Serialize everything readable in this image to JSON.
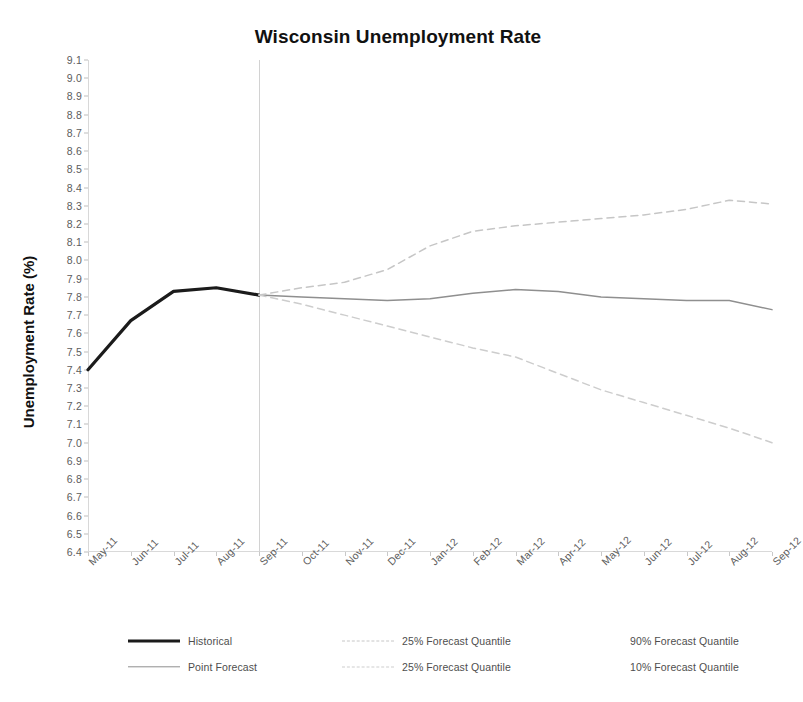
{
  "chart_data": {
    "type": "line",
    "title": "Wisconsin Unemployment Rate",
    "xlabel": "",
    "ylabel": "Unemployment Rate (%)",
    "ylim": [
      6.4,
      9.1
    ],
    "ytick_step": 0.1,
    "grid": false,
    "legend_position": "bottom",
    "forecast_start": "Sep-11",
    "categories": [
      "May-11",
      "Jun-11",
      "Jul-11",
      "Aug-11",
      "Sep-11",
      "Oct-11",
      "Nov-11",
      "Dec-11",
      "Jan-12",
      "Feb-12",
      "Mar-12",
      "Apr-12",
      "May-12",
      "Jun-12",
      "Jul-12",
      "Aug-12",
      "Sep-12"
    ],
    "yticks": [
      "9.1",
      "9.0",
      "8.9",
      "8.8",
      "8.7",
      "8.6",
      "8.5",
      "8.4",
      "8.3",
      "8.2",
      "8.1",
      "8.0",
      "7.9",
      "7.8",
      "7.7",
      "7.6",
      "7.5",
      "7.4",
      "7.3",
      "7.2",
      "7.1",
      "7.0",
      "6.9",
      "6.8",
      "6.7",
      "6.6",
      "6.5",
      "6.4"
    ],
    "series": [
      {
        "name": "Historical",
        "style": "solid-thick",
        "color": "#1b1b1b",
        "values": [
          7.4,
          7.67,
          7.83,
          7.85,
          7.81,
          null,
          null,
          null,
          null,
          null,
          null,
          null,
          null,
          null,
          null,
          null,
          null
        ]
      },
      {
        "name": "Point Forecast",
        "style": "solid-thin",
        "color": "#8f8f8f",
        "values": [
          null,
          null,
          null,
          null,
          7.81,
          7.8,
          7.79,
          7.78,
          7.79,
          7.82,
          7.84,
          7.83,
          7.8,
          7.79,
          7.78,
          7.78,
          7.73
        ]
      },
      {
        "name": "25% Forecast Quantile",
        "style": "dashed",
        "color": "#c6c6c6",
        "values": [
          null,
          null,
          null,
          null,
          7.81,
          7.85,
          7.88,
          7.95,
          8.08,
          8.16,
          8.19,
          8.21,
          8.23,
          8.25,
          8.28,
          8.33,
          8.31
        ]
      },
      {
        "name": "25% Forecast Quantile",
        "style": "dashed",
        "color": "#cdcdcd",
        "values": [
          null,
          null,
          null,
          null,
          7.81,
          7.76,
          7.7,
          7.64,
          7.58,
          7.52,
          7.47,
          7.38,
          7.29,
          7.22,
          7.15,
          7.08,
          7.0
        ]
      }
    ]
  },
  "legend": {
    "rows": [
      [
        {
          "label": "Historical",
          "swatch": "historical"
        },
        {
          "label": "25% Forecast Quantile",
          "swatch": "dash"
        },
        {
          "label": "90% Forecast Quantile",
          "swatch": "none"
        }
      ],
      [
        {
          "label": "Point Forecast",
          "swatch": "point"
        },
        {
          "label": "25% Forecast Quantile",
          "swatch": "dash2"
        },
        {
          "label": "10% Forecast Quantile",
          "swatch": "none"
        }
      ]
    ]
  },
  "colors": {
    "historical": "#1b1b1b",
    "point_forecast": "#8f8f8f",
    "upper_quantile": "#c6c6c6",
    "lower_quantile": "#cdcdcd",
    "axis": "#d8d8d8",
    "tick_text": "#5c5c5c"
  }
}
